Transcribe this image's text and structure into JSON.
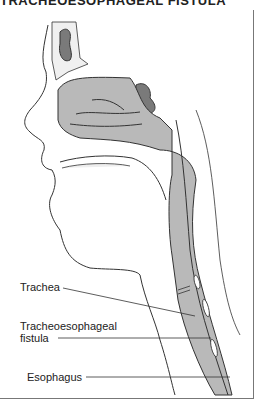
{
  "title": "TRACHEOESOPHAGEAL FISTULA",
  "labels": {
    "trachea": "Trachea",
    "fistula_line1": "Tracheoesophageal",
    "fistula_line2": "fistula",
    "esophagus": "Esophagus"
  },
  "colors": {
    "tissue_fill": "#b9b9b9",
    "sinus_fill": "#7a7a7a",
    "outline": "#333333",
    "background": "#ffffff"
  }
}
